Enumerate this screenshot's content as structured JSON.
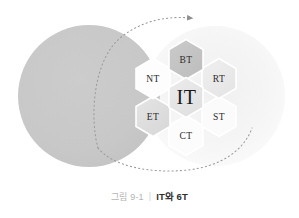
{
  "figure": {
    "caption_number": "그림 9-1",
    "caption_separator": "|",
    "caption_title": "IT와 6T",
    "alt_summary": "IT와 6T 벤다이어그램"
  },
  "colors": {
    "left_circle": "#c9c9c9",
    "right_circle": "#f4f4f4",
    "hex_dark": "#c4c4c4",
    "hex_mid": "#e0e0e0",
    "hex_light": "#efefef",
    "hex_white": "#ffffff",
    "hex_stroke": "#ffffff",
    "dotted_line": "#9a9a9a",
    "label_text": "#2b2b2b",
    "caption_number": "#b4b4b4",
    "caption_title": "#2e2e2e",
    "background": "#ffffff"
  },
  "circles": [
    {
      "id": "left-circle",
      "label": "IT domain circle",
      "cx": 89,
      "cy": 96,
      "r": 71,
      "fill": "#c9c9c9"
    },
    {
      "id": "right-circle",
      "label": "6T domain circle",
      "cx": 215,
      "cy": 96,
      "r": 70,
      "fill": "#f4f4f4"
    }
  ],
  "hexagons": [
    {
      "id": "hex-it",
      "label": "IT",
      "cx": 186,
      "cy": 96,
      "fill": "#e6e6e6",
      "size": "large"
    },
    {
      "id": "hex-bt",
      "label": "BT",
      "cx": 186,
      "cy": 58,
      "fill": "#c4c4c4",
      "size": "small"
    },
    {
      "id": "hex-nt",
      "label": "NT",
      "cx": 153,
      "cy": 77,
      "fill": "#fdfdfd",
      "size": "small"
    },
    {
      "id": "hex-rt",
      "label": "RT",
      "cx": 219,
      "cy": 77,
      "fill": "#eaeaea",
      "size": "small"
    },
    {
      "id": "hex-et",
      "label": "ET",
      "cx": 153,
      "cy": 115,
      "fill": "#dedede",
      "size": "small"
    },
    {
      "id": "hex-st",
      "label": "ST",
      "cx": 219,
      "cy": 115,
      "fill": "#fbfbfb",
      "size": "small"
    },
    {
      "id": "hex-ct",
      "label": "CT",
      "cx": 186,
      "cy": 134,
      "fill": "#fcfcfc",
      "size": "small"
    }
  ],
  "annotations": {
    "arrow": {
      "id": "dotted-arc-arrow",
      "description": "dotted elliptical arc with arrowhead pointing right at top",
      "style": "dotted",
      "arrowhead": "right"
    }
  }
}
